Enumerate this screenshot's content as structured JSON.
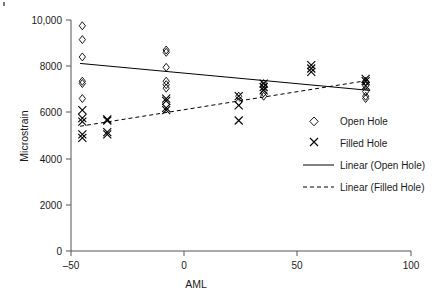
{
  "chart_data": {
    "type": "scatter",
    "title": "",
    "xlabel": "AML",
    "ylabel": "Microstrain",
    "xlim": [
      -50,
      100
    ],
    "ylim": [
      0,
      10000
    ],
    "xticks": [
      -50,
      0,
      50,
      100
    ],
    "xticklabels": [
      "–50",
      "0",
      "50",
      "100"
    ],
    "yticks": [
      0,
      2000,
      4000,
      6000,
      8000,
      10000
    ],
    "yticklabels": [
      "0",
      "2000",
      "4000",
      "6000",
      "8000",
      "10,000"
    ],
    "grid": false,
    "legend_position": "right",
    "series": [
      {
        "name": "Open Hole",
        "marker": "diamond",
        "points": [
          [
            -45,
            9750
          ],
          [
            -45,
            9150
          ],
          [
            -45,
            8400
          ],
          [
            -45,
            7350
          ],
          [
            -45,
            7250
          ],
          [
            -45,
            6600
          ],
          [
            -8,
            8700
          ],
          [
            -8,
            8600
          ],
          [
            -8,
            7950
          ],
          [
            -8,
            7350
          ],
          [
            -8,
            7200
          ],
          [
            -8,
            7050
          ],
          [
            24,
            6700
          ],
          [
            24,
            6450
          ],
          [
            35,
            7250
          ],
          [
            35,
            7150
          ],
          [
            35,
            6850
          ],
          [
            35,
            6700
          ],
          [
            80,
            7350
          ],
          [
            80,
            7150
          ],
          [
            80,
            6900
          ],
          [
            80,
            6700
          ],
          [
            80,
            6600
          ]
        ]
      },
      {
        "name": "Filled Hole",
        "marker": "cross",
        "points": [
          [
            -45,
            6100
          ],
          [
            -45,
            5750
          ],
          [
            -45,
            5600
          ],
          [
            -45,
            5050
          ],
          [
            -45,
            4900
          ],
          [
            -34,
            5700
          ],
          [
            -34,
            5650
          ],
          [
            -34,
            5150
          ],
          [
            -34,
            5050
          ],
          [
            -8,
            6600
          ],
          [
            -8,
            6500
          ],
          [
            -8,
            6200
          ],
          [
            -8,
            6100
          ],
          [
            24,
            6700
          ],
          [
            24,
            6300
          ],
          [
            24,
            5650
          ],
          [
            35,
            7250
          ],
          [
            35,
            7100
          ],
          [
            35,
            6950
          ],
          [
            56,
            8050
          ],
          [
            56,
            7900
          ],
          [
            56,
            7750
          ],
          [
            80,
            7450
          ],
          [
            80,
            7350
          ],
          [
            80,
            7150
          ]
        ]
      }
    ],
    "trendlines": [
      {
        "name": "Linear (Open Hole)",
        "style": "solid",
        "x_start": -46,
        "y_start": 8120,
        "x_end": 82,
        "y_end": 6950
      },
      {
        "name": "Linear (Filled Hole)",
        "style": "dashed",
        "x_start": -46,
        "y_start": 5400,
        "x_end": 82,
        "y_end": 7400
      }
    ]
  },
  "legend": {
    "items": [
      {
        "label": "Open Hole",
        "symbol": "diamond"
      },
      {
        "label": "Filled Hole",
        "symbol": "cross"
      },
      {
        "label": "Linear (Open Hole)",
        "symbol": "solid-line"
      },
      {
        "label": "Linear (Filled Hole)",
        "symbol": "dashed-line"
      }
    ]
  },
  "axes": {
    "x_title": "AML",
    "y_title": "Microstrain",
    "x_tick_labels": [
      "–50",
      "0",
      "50",
      "100"
    ],
    "y_tick_labels": [
      "10,000",
      "8000",
      "6000",
      "4000",
      "2000",
      "0"
    ]
  }
}
